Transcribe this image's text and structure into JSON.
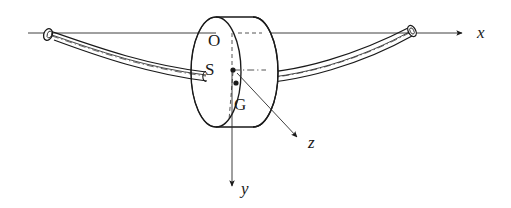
{
  "figure": {
    "kind": "engineering-schematic",
    "background_color": "#ffffff",
    "stroke_color": "#1a1a1a",
    "axis_color": "#2a2a2a",
    "width": 511,
    "height": 208
  },
  "axes": {
    "x": {
      "label": "x",
      "direction": "right",
      "arrow": true,
      "line_from": [
        28,
        33
      ],
      "line_to": [
        466,
        33
      ],
      "label_pos": [
        478,
        25
      ]
    },
    "y": {
      "label": "y",
      "direction": "down",
      "arrow": true,
      "line_from": [
        232,
        70
      ],
      "line_to": [
        232,
        190
      ],
      "label_pos": [
        241,
        182
      ]
    },
    "z": {
      "label": "z",
      "direction": "down-right",
      "arrow": true,
      "line_from": [
        237,
        72
      ],
      "line_to": [
        300,
        140
      ],
      "label_pos": [
        309,
        138
      ]
    }
  },
  "points": [
    {
      "label": "O",
      "name": "geometric-center-O",
      "meaning": "disk geometric center on bearing axis",
      "label_pos": [
        212,
        36
      ],
      "marker": false
    },
    {
      "label": "S",
      "name": "shaft-center-S",
      "meaning": "shaft elastic center",
      "label_pos": [
        207,
        62
      ],
      "marker": true,
      "marker_pos": [
        233,
        70
      ]
    },
    {
      "label": "G",
      "name": "mass-center-G",
      "meaning": "disk center of gravity",
      "label_pos": [
        236,
        98
      ],
      "marker": true,
      "marker_pos": [
        236,
        83
      ]
    }
  ],
  "disk": {
    "name": "rotor-disk",
    "front_face_center": [
      216,
      72
    ],
    "front_face_rx": 25,
    "front_face_ry": 55,
    "back_face_center": [
      253,
      72
    ],
    "back_face_rx": 25,
    "back_face_ry": 55
  },
  "shaft": {
    "name": "flexible-shaft",
    "left_bearing": [
      47,
      33
    ],
    "right_bearing": [
      413,
      33
    ],
    "deflection": "bowed-downward",
    "centerline_style": "dash-dot"
  }
}
